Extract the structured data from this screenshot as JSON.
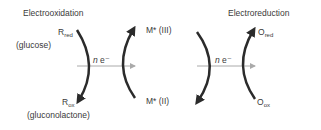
{
  "title_left": "Electrooxidation",
  "title_right": "Electroreduction",
  "left": {
    "top_main": "R",
    "top_sub": "red",
    "top_name": "(glucose)",
    "bottom_main": "R",
    "bottom_sub": "ox",
    "bottom_name": "(gluconolactone)"
  },
  "middle": {
    "top": "M* (III)",
    "bottom": "M* (II)"
  },
  "right": {
    "top_main": "O",
    "top_sub": "red",
    "bottom_main": "O",
    "bottom_sub": "ox"
  },
  "electron_transfer": {
    "n": "n",
    "e": " e⁻"
  },
  "colors": {
    "arc": "#2b2b2b",
    "arrow": "#aaaaaa",
    "text": "#3a3a3a"
  }
}
